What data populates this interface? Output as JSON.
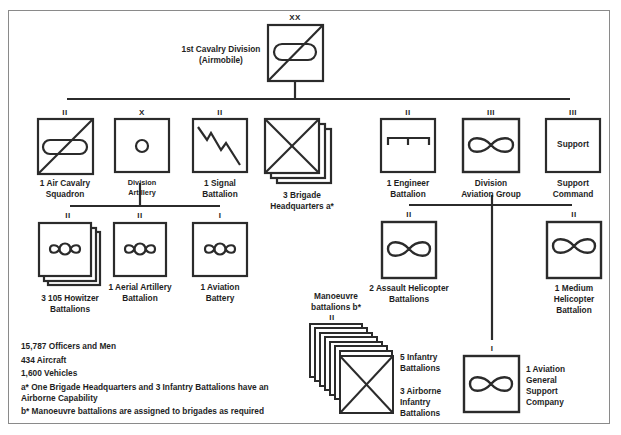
{
  "diagram": {
    "title": "1st Cavalry Division",
    "subtitle": "(Airmobile)",
    "root": {
      "echelon": "XX",
      "label": [
        "1st Cavalry Division",
        "(Airmobile)"
      ],
      "symbol": "air-cavalry"
    },
    "level1": [
      {
        "id": "air-cav-squadron",
        "echelon": "II",
        "label": [
          "1 Air Cavalry",
          "Squadron"
        ],
        "symbol": "air-cavalry"
      },
      {
        "id": "division-artillery",
        "echelon": "X",
        "label": [
          "Division",
          "Artillery"
        ],
        "symbol": "artillery"
      },
      {
        "id": "signal-battalion",
        "echelon": "II",
        "label": [
          "1 Signal",
          "Battalion"
        ],
        "symbol": "signal"
      },
      {
        "id": "brigade-hq",
        "echelon": "",
        "label": [
          "3 Brigade",
          "Headquarters a*"
        ],
        "symbol": "infantry-stack-3"
      },
      {
        "id": "engineer-battalion",
        "echelon": "II",
        "label": [
          "1 Engineer",
          "Battalion"
        ],
        "symbol": "engineer"
      },
      {
        "id": "division-aviation-group",
        "echelon": "III",
        "label": [
          "Division",
          "Aviation Group"
        ],
        "symbol": "aviation"
      },
      {
        "id": "support-command",
        "echelon": "III",
        "label": [
          "Support",
          "Command"
        ],
        "symbol": "text",
        "symbol_text": "Support"
      }
    ],
    "artillery_children": [
      {
        "id": "howitzer-battalions",
        "echelon": "II",
        "label": [
          "3 105 Howitzer",
          "Battalions"
        ],
        "symbol": "artillery-aviation-stack"
      },
      {
        "id": "aerial-artillery",
        "echelon": "II",
        "label": [
          "1 Aerial Artillery",
          "Battalion"
        ],
        "symbol": "artillery-aviation"
      },
      {
        "id": "aviation-battery",
        "echelon": "I",
        "label": [
          "1 Aviation",
          "Battery"
        ],
        "symbol": "artillery-aviation"
      }
    ],
    "aviation_children": [
      {
        "id": "assault-helicopter",
        "echelon": "II",
        "label": [
          "2 Assault Helicopter",
          "Battalions"
        ],
        "symbol": "aviation"
      },
      {
        "id": "medium-helicopter",
        "echelon": "II",
        "label": [
          "1 Medium",
          "Helicopter",
          "Battalion"
        ],
        "symbol": "aviation"
      },
      {
        "id": "aviation-general-support",
        "echelon": "I",
        "label": [
          "1 Aviation",
          "General",
          "Support",
          "Company"
        ],
        "symbol": "aviation"
      }
    ],
    "manoeuvre": {
      "header": [
        "Manoeuvre",
        "battalions b*"
      ],
      "echelon": "II",
      "labels_a": [
        "5 Infantry",
        "Battalions"
      ],
      "labels_b": [
        "3 Airborne",
        "Infantry",
        "Battalions"
      ],
      "stack_count": 8
    },
    "notes": [
      "15,787 Officers and Men",
      "434 Aircraft",
      "1,600 Vehicles",
      "a* One Brigade Headquarters and 3 Infantry Battalions have an",
      "Airborne Capability",
      "b* Manoeuvre battalions are assigned to brigades as required"
    ],
    "colors": {
      "line": "#2b2b2b",
      "frame": "#8a8a8a",
      "background": "#ffffff"
    }
  }
}
